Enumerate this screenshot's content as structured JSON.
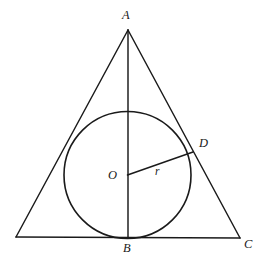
{
  "figure": {
    "type": "geometry-diagram",
    "background_color": "#ffffff",
    "stroke_color": "#1a1a1a",
    "labels": {
      "apex": "A",
      "base_midpoint": "B",
      "base_right_vertex": "C",
      "tangent_point_right": "D",
      "circle_center": "O",
      "radius": "r"
    },
    "points": {
      "A": {
        "x": 128,
        "y": 30
      },
      "base_left": {
        "x": 16,
        "y": 237
      },
      "B": {
        "x": 128,
        "y": 238
      },
      "C": {
        "x": 240,
        "y": 238
      },
      "D": {
        "x": 193,
        "y": 152
      },
      "O": {
        "x": 127.5,
        "y": 175
      }
    },
    "circle": {
      "center_x": 127.5,
      "center_y": 175,
      "radius": 63.5
    },
    "segments": [
      {
        "name": "side-AB-left",
        "from": "A",
        "to": "base_left"
      },
      {
        "name": "side-AC-right",
        "from": "A",
        "to": "C"
      },
      {
        "name": "base-BC",
        "from": "base_left",
        "to": "C"
      },
      {
        "name": "altitude-AB",
        "from": "A",
        "to": "B"
      },
      {
        "name": "radius-OD",
        "from": "O",
        "to": "D"
      }
    ]
  }
}
